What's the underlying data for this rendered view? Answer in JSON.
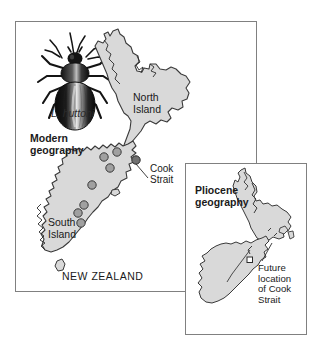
{
  "figure": {
    "background": "#ffffff",
    "land_fill": "#d9d9d9",
    "land_stroke": "#3a3a3a",
    "dot_fill": "#a0a0a0",
    "dot_stroke": "#3a3a3a",
    "panel_border": "#808080"
  },
  "main_panel": {
    "name": "modern-geography-panel",
    "specimen": {
      "image_name": "beetle-illustration",
      "caption": "L. huttoni",
      "caption_style": "italic"
    },
    "labels": {
      "modern_geography": "Modern\ngeography",
      "north_island": "North\nIsland",
      "south_island": "South\nIsland",
      "cook_strait": "Cook\nStrait",
      "country": "NEW ZEALAND"
    },
    "collection_sites": {
      "count": 8,
      "symbol": "filled-gray-circle",
      "points": [
        {
          "x": 115,
          "y": 152
        },
        {
          "x": 103,
          "y": 158
        },
        {
          "x": 109,
          "y": 168
        },
        {
          "x": 91,
          "y": 185
        },
        {
          "x": 84,
          "y": 204
        },
        {
          "x": 78,
          "y": 212
        },
        {
          "x": 80,
          "y": 222
        },
        {
          "x": 135,
          "y": 160
        }
      ]
    }
  },
  "inset_panel": {
    "name": "pliocene-geography-panel",
    "labels": {
      "pliocene_geography": "Pliocene\ngeography",
      "future_location": "Future\nlocation\nof Cook\nStrait"
    },
    "marker": {
      "symbol": "small-open-square",
      "meaning": "future-location-of-cook-strait"
    }
  }
}
